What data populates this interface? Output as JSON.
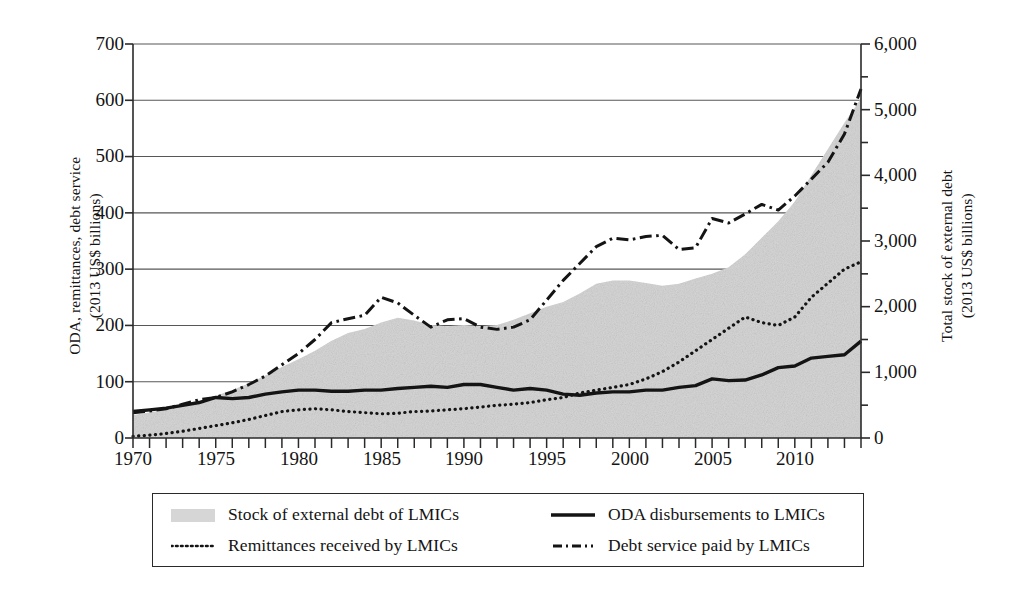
{
  "axes": {
    "left_title_line1": "ODA, remittances, debt service",
    "left_title_line2": "(2013 US$ billions)",
    "right_title_line1": "Total stock of external debt",
    "right_title_line2": "(2013 US$ billions)",
    "left_ticks": [
      "0",
      "100",
      "200",
      "300",
      "400",
      "500",
      "600",
      "700"
    ],
    "right_ticks": [
      "0",
      "1,000",
      "2,000",
      "3,000",
      "4,000",
      "5,000",
      "6,000"
    ],
    "x_ticks": [
      "1970",
      "1975",
      "1980",
      "1985",
      "1990",
      "1995",
      "2000",
      "2005",
      "2010"
    ]
  },
  "legend": {
    "items": [
      {
        "label": "Stock of external debt of LMICs",
        "marker": "area-swatch"
      },
      {
        "label": "ODA disbursements to LMICs",
        "marker": "solid-line-swatch"
      },
      {
        "label": "Remittances received by LMICs",
        "marker": "dotted-line-swatch"
      },
      {
        "label": "Debt service paid by LMICs",
        "marker": "dash-dot-line-swatch"
      }
    ]
  },
  "colors": {
    "area_fill": "#d6d6d6",
    "line": "#141414",
    "grid": "#575757",
    "axis": "#2a2a2a",
    "background": "#ffffff"
  },
  "chart_data": {
    "type": "area",
    "title": "",
    "xlabel": "",
    "ylabel": "ODA, remittances, debt service (2013 US$ billions)",
    "y2label": "Total stock of external debt (2013 US$ billions)",
    "xlim": [
      1970,
      2014
    ],
    "ylim": [
      0,
      700
    ],
    "y2lim": [
      0,
      6000
    ],
    "grid": true,
    "legend_position": "below-plot",
    "x": [
      1970,
      1971,
      1972,
      1973,
      1974,
      1975,
      1976,
      1977,
      1978,
      1979,
      1980,
      1981,
      1982,
      1983,
      1984,
      1985,
      1986,
      1987,
      1988,
      1989,
      1990,
      1991,
      1992,
      1993,
      1994,
      1995,
      1996,
      1997,
      1998,
      1999,
      2000,
      2001,
      2002,
      2003,
      2004,
      2005,
      2006,
      2007,
      2008,
      2009,
      2010,
      2011,
      2012,
      2013,
      2014
    ],
    "series": [
      {
        "name": "Stock of external debt of LMICs",
        "axis": "right",
        "style": "filled-area",
        "units": "2013 US$ billions",
        "values": [
          350,
          390,
          430,
          490,
          560,
          640,
          730,
          830,
          950,
          1080,
          1200,
          1330,
          1480,
          1600,
          1660,
          1760,
          1830,
          1790,
          1720,
          1700,
          1720,
          1700,
          1720,
          1800,
          1900,
          2000,
          2070,
          2200,
          2350,
          2400,
          2400,
          2360,
          2320,
          2350,
          2430,
          2500,
          2600,
          2800,
          3050,
          3300,
          3600,
          4000,
          4400,
          4800,
          5170
        ]
      },
      {
        "name": "ODA disbursements to LMICs",
        "axis": "left",
        "style": "solid",
        "units": "2013 US$ billions",
        "values": [
          47,
          50,
          53,
          58,
          63,
          72,
          70,
          72,
          78,
          82,
          85,
          85,
          83,
          83,
          85,
          85,
          88,
          90,
          92,
          90,
          95,
          95,
          90,
          85,
          88,
          85,
          78,
          76,
          80,
          82,
          82,
          85,
          85,
          90,
          93,
          105,
          102,
          103,
          112,
          125,
          128,
          142,
          145,
          148,
          172
        ]
      },
      {
        "name": "Remittances received by LMICs",
        "axis": "left",
        "style": "dotted",
        "units": "2013 US$ billions",
        "values": [
          3,
          5,
          8,
          12,
          17,
          22,
          27,
          33,
          40,
          47,
          50,
          52,
          50,
          47,
          45,
          43,
          44,
          47,
          48,
          50,
          52,
          55,
          58,
          60,
          63,
          68,
          72,
          80,
          85,
          90,
          95,
          105,
          118,
          135,
          155,
          175,
          195,
          215,
          205,
          200,
          215,
          250,
          275,
          300,
          313
        ]
      },
      {
        "name": "Debt service paid by LMICs",
        "axis": "left",
        "style": "dash-dot",
        "units": "2013 US$ billions",
        "values": [
          45,
          48,
          52,
          60,
          68,
          72,
          82,
          95,
          110,
          130,
          150,
          175,
          205,
          212,
          218,
          250,
          240,
          218,
          197,
          210,
          212,
          197,
          193,
          197,
          210,
          245,
          280,
          310,
          340,
          355,
          352,
          358,
          360,
          335,
          338,
          390,
          382,
          398,
          415,
          405,
          430,
          460,
          490,
          540,
          620
        ]
      }
    ]
  }
}
